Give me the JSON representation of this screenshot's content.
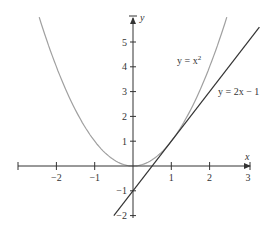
{
  "chart_data": {
    "type": "line",
    "title": "",
    "xlabel": "x",
    "ylabel": "y",
    "xlim": [
      -3,
      3
    ],
    "ylim": [
      -2,
      6
    ],
    "grid": false,
    "x_ticks": [
      -2,
      -1,
      1,
      2,
      3
    ],
    "y_ticks": [
      -2,
      -1,
      1,
      2,
      3,
      4,
      5
    ],
    "x_tick_labels": [
      "−2",
      "−1",
      "1",
      "2",
      "3"
    ],
    "y_tick_labels": [
      "−2",
      "−1",
      "1",
      "2",
      "3",
      "4",
      "5"
    ],
    "series": [
      {
        "name": "y = x²",
        "label_main": "y = x",
        "label_sup": "2",
        "equation": "y = x^2",
        "color": "#a0a0a0",
        "x": [
          -2.45,
          -2,
          -1.5,
          -1,
          -0.5,
          0,
          0.5,
          1,
          1.5,
          2,
          2.45
        ],
        "values": [
          6.0,
          4,
          2.25,
          1,
          0.25,
          0,
          0.25,
          1,
          2.25,
          4,
          6.0
        ]
      },
      {
        "name": "y = 2x − 1",
        "label_main": "y = 2x − 1",
        "equation": "y = 2x - 1",
        "color": "#333333",
        "x": [
          -0.5,
          3.3
        ],
        "values": [
          -2,
          5.6
        ]
      }
    ],
    "annotations": [
      {
        "text": "y = x²",
        "near": [
          1.2,
          4.2
        ]
      },
      {
        "text": "y = 2x − 1",
        "near": [
          2.3,
          3.0
        ]
      }
    ]
  }
}
